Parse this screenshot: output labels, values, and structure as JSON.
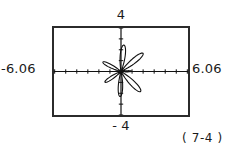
{
  "figure": {
    "caption": "( 7-4 )",
    "window": {
      "xmin_label": "-6.06",
      "xmax_label": "6.06",
      "ymax_label": "4",
      "ymin_label": "- 4"
    }
  },
  "chart_data": {
    "type": "line",
    "title": "",
    "subtitle": "",
    "plot_kind": "polar rose curve on graphing-calculator screen",
    "xlabel": "",
    "ylabel": "",
    "xlim": [
      -6.06,
      6.06
    ],
    "ylim": [
      -4,
      4
    ],
    "x_tick_labels": [
      "-6.06",
      "6.06"
    ],
    "y_tick_labels": [
      "4",
      "- 4"
    ],
    "x_tick_step": 1,
    "y_tick_step": 1,
    "grid": false,
    "axes_shown": true,
    "axis_ticks_shown": true,
    "legend": false,
    "annotations": [
      "( 7-4 )"
    ],
    "series": [
      {
        "name": "polar rose",
        "coord_system": "polar",
        "petal_count": 7,
        "max_radius": 2.5,
        "petals": [
          {
            "angle_deg": 84,
            "length": 2.45,
            "half_width_deg": 15
          },
          {
            "angle_deg": 40,
            "length": 2.6,
            "half_width_deg": 14
          },
          {
            "angle_deg": 2,
            "length": 0.95,
            "half_width_deg": 9
          },
          {
            "angle_deg": -46,
            "length": 2.55,
            "half_width_deg": 15
          },
          {
            "angle_deg": -92,
            "length": 2.3,
            "half_width_deg": 14
          },
          {
            "angle_deg": 152,
            "length": 1.85,
            "half_width_deg": 13
          },
          {
            "angle_deg": 214,
            "length": 1.75,
            "half_width_deg": 13
          }
        ]
      }
    ]
  }
}
